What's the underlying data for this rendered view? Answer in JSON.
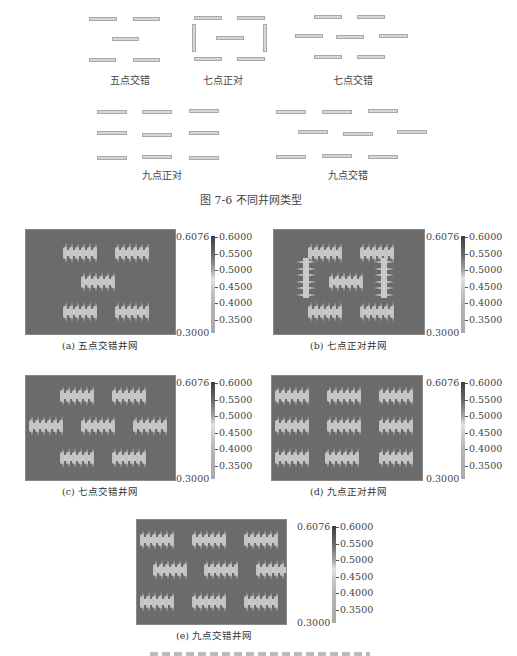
{
  "figure_7_6": {
    "caption": "图 7-6    不同井网类型",
    "patterns": [
      {
        "id": "five-spot-staggered",
        "label": "五点交错"
      },
      {
        "id": "seven-spot-aligned",
        "label": "七点正对"
      },
      {
        "id": "seven-spot-staggered",
        "label": "七点交错"
      },
      {
        "id": "nine-spot-aligned",
        "label": "九点正对"
      },
      {
        "id": "nine-spot-staggered",
        "label": "九点交错"
      }
    ]
  },
  "figure_7_7": {
    "colorbar": {
      "max_label": "0.6076",
      "min_label": "0.3000",
      "ticks": [
        "0.6000",
        "0.5500",
        "0.5000",
        "0.4500",
        "0.4000",
        "0.3500"
      ]
    },
    "subplots": [
      {
        "id": "a",
        "caption": "(a) 五点交错井网"
      },
      {
        "id": "b",
        "caption": "(b) 七点正对井网"
      },
      {
        "id": "c",
        "caption": "(c) 七点交错井网"
      },
      {
        "id": "d",
        "caption": "(d) 九点正对井网"
      },
      {
        "id": "e",
        "caption": "(e) 九点交错井网"
      }
    ]
  },
  "chart_data": [
    {
      "type": "heatmap",
      "title": "(a) 五点交错井网",
      "colorbar_range": [
        0.3,
        0.6076
      ],
      "colorbar_ticks": [
        0.35,
        0.4,
        0.45,
        0.5,
        0.55,
        0.6
      ],
      "wells": 5
    },
    {
      "type": "heatmap",
      "title": "(b) 七点正对井网",
      "colorbar_range": [
        0.3,
        0.6076
      ],
      "colorbar_ticks": [
        0.35,
        0.4,
        0.45,
        0.5,
        0.55,
        0.6
      ],
      "wells": 7
    },
    {
      "type": "heatmap",
      "title": "(c) 七点交错井网",
      "colorbar_range": [
        0.3,
        0.6076
      ],
      "colorbar_ticks": [
        0.35,
        0.4,
        0.45,
        0.5,
        0.55,
        0.6
      ],
      "wells": 7
    },
    {
      "type": "heatmap",
      "title": "(d) 九点正对井网",
      "colorbar_range": [
        0.3,
        0.6076
      ],
      "colorbar_ticks": [
        0.35,
        0.4,
        0.45,
        0.5,
        0.55,
        0.6
      ],
      "wells": 9
    },
    {
      "type": "heatmap",
      "title": "(e) 九点交错井网",
      "colorbar_range": [
        0.3,
        0.6076
      ],
      "colorbar_ticks": [
        0.35,
        0.4,
        0.45,
        0.5,
        0.55,
        0.6
      ],
      "wells": 9
    }
  ]
}
